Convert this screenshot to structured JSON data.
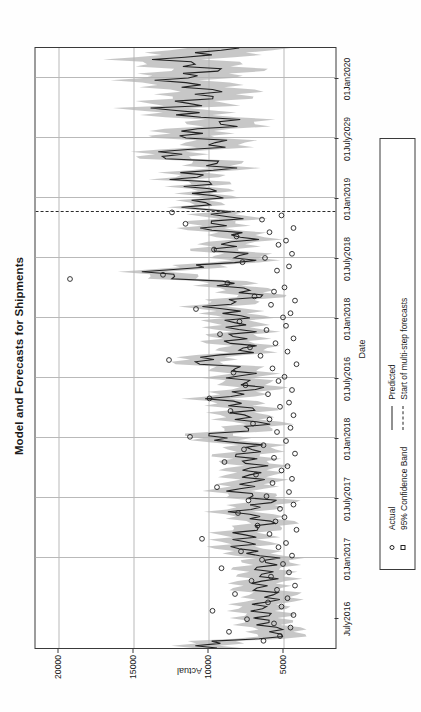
{
  "chart_data": {
    "type": "line",
    "title": "Model and Forecasts for Shipments",
    "xlabel": "Date",
    "ylabel": "Actual",
    "grid": true,
    "legend_position": "below-plot",
    "xtick_labels": [
      "July2016",
      "01Jan2017",
      "01July2017",
      "01Jan2018",
      "01July2016",
      "01Jan2018",
      "01July2018",
      "01Jan2019",
      "01July2029",
      "01Jan2020"
    ],
    "ytick_labels": [
      "5000",
      "10000",
      "15000",
      "20000"
    ],
    "ylim": [
      1500,
      21500
    ],
    "yticks": [
      5000,
      10000,
      15000,
      20000
    ],
    "forecast_start_label": "Start of multi-step forecasts",
    "forecast_start_x_fraction": 0.726,
    "series": [
      {
        "name": "Actual",
        "marker": "open-circle",
        "values": [
          [
            0.012,
            6300
          ],
          [
            0.02,
            5200
          ],
          [
            0.027,
            8600
          ],
          [
            0.034,
            4500
          ],
          [
            0.041,
            5600
          ],
          [
            0.048,
            7400
          ],
          [
            0.055,
            4300
          ],
          [
            0.062,
            9700
          ],
          [
            0.069,
            5100
          ],
          [
            0.076,
            6000
          ],
          [
            0.083,
            4700
          ],
          [
            0.09,
            8200
          ],
          [
            0.097,
            5400
          ],
          [
            0.104,
            4200
          ],
          [
            0.112,
            7100
          ],
          [
            0.119,
            5800
          ],
          [
            0.126,
            4600
          ],
          [
            0.133,
            9100
          ],
          [
            0.14,
            5000
          ],
          [
            0.147,
            6400
          ],
          [
            0.154,
            4400
          ],
          [
            0.161,
            7800
          ],
          [
            0.168,
            5300
          ],
          [
            0.175,
            4800
          ],
          [
            0.182,
            10400
          ],
          [
            0.19,
            5900
          ],
          [
            0.197,
            4100
          ],
          [
            0.204,
            6700
          ],
          [
            0.211,
            5500
          ],
          [
            0.218,
            4900
          ],
          [
            0.225,
            8000
          ],
          [
            0.232,
            5200
          ],
          [
            0.239,
            4300
          ],
          [
            0.246,
            7300
          ],
          [
            0.253,
            6100
          ],
          [
            0.26,
            4600
          ],
          [
            0.268,
            9400
          ],
          [
            0.275,
            5700
          ],
          [
            0.282,
            4400
          ],
          [
            0.289,
            6800
          ],
          [
            0.296,
            5100
          ],
          [
            0.303,
            4700
          ],
          [
            0.31,
            8900
          ],
          [
            0.317,
            5600
          ],
          [
            0.324,
            4200
          ],
          [
            0.331,
            7600
          ],
          [
            0.338,
            6300
          ],
          [
            0.345,
            4800
          ],
          [
            0.352,
            11200
          ],
          [
            0.36,
            5400
          ],
          [
            0.367,
            4500
          ],
          [
            0.374,
            7000
          ],
          [
            0.381,
            5900
          ],
          [
            0.388,
            4300
          ],
          [
            0.395,
            8500
          ],
          [
            0.402,
            5200
          ],
          [
            0.409,
            4600
          ],
          [
            0.416,
            9900
          ],
          [
            0.423,
            6000
          ],
          [
            0.43,
            4400
          ],
          [
            0.438,
            7500
          ],
          [
            0.445,
            5300
          ],
          [
            0.452,
            4900
          ],
          [
            0.459,
            8300
          ],
          [
            0.466,
            5700
          ],
          [
            0.473,
            4100
          ],
          [
            0.48,
            12600
          ],
          [
            0.487,
            6500
          ],
          [
            0.494,
            4700
          ],
          [
            0.501,
            7200
          ],
          [
            0.508,
            5500
          ],
          [
            0.516,
            4300
          ],
          [
            0.523,
            9200
          ],
          [
            0.53,
            6100
          ],
          [
            0.537,
            4800
          ],
          [
            0.544,
            7900
          ],
          [
            0.551,
            5000
          ],
          [
            0.558,
            4500
          ],
          [
            0.565,
            10800
          ],
          [
            0.572,
            5800
          ],
          [
            0.579,
            4200
          ],
          [
            0.586,
            6900
          ],
          [
            0.594,
            5600
          ],
          [
            0.601,
            4900
          ],
          [
            0.608,
            8700
          ],
          [
            0.615,
            19200
          ],
          [
            0.622,
            13000
          ],
          [
            0.629,
            5400
          ],
          [
            0.636,
            4600
          ],
          [
            0.643,
            7700
          ],
          [
            0.65,
            6200
          ],
          [
            0.657,
            4400
          ],
          [
            0.664,
            9600
          ],
          [
            0.672,
            5300
          ],
          [
            0.679,
            4800
          ],
          [
            0.686,
            8100
          ],
          [
            0.693,
            5900
          ],
          [
            0.7,
            4300
          ],
          [
            0.707,
            11500
          ],
          [
            0.714,
            6400
          ],
          [
            0.721,
            5100
          ],
          [
            0.726,
            12400
          ]
        ]
      },
      {
        "name": "Predicted",
        "marker": "none",
        "style": "solid",
        "values": [
          [
            0.012,
            6000
          ],
          [
            0.034,
            5400
          ],
          [
            0.055,
            6800
          ],
          [
            0.076,
            5900
          ],
          [
            0.097,
            6200
          ],
          [
            0.119,
            6500
          ],
          [
            0.14,
            5800
          ],
          [
            0.161,
            7000
          ],
          [
            0.182,
            8200
          ],
          [
            0.204,
            6100
          ],
          [
            0.225,
            7400
          ],
          [
            0.246,
            6300
          ],
          [
            0.268,
            8000
          ],
          [
            0.289,
            6600
          ],
          [
            0.31,
            7600
          ],
          [
            0.331,
            6900
          ],
          [
            0.352,
            9400
          ],
          [
            0.374,
            6700
          ],
          [
            0.395,
            7800
          ],
          [
            0.416,
            8600
          ],
          [
            0.438,
            7100
          ],
          [
            0.459,
            7900
          ],
          [
            0.48,
            10200
          ],
          [
            0.501,
            7300
          ],
          [
            0.523,
            8400
          ],
          [
            0.544,
            7600
          ],
          [
            0.565,
            9300
          ],
          [
            0.586,
            7200
          ],
          [
            0.608,
            8100
          ],
          [
            0.622,
            14800
          ],
          [
            0.643,
            7800
          ],
          [
            0.664,
            8700
          ],
          [
            0.686,
            7900
          ],
          [
            0.707,
            9800
          ],
          [
            0.726,
            8600
          ],
          [
            0.74,
            11300
          ],
          [
            0.76,
            9200
          ],
          [
            0.78,
            11900
          ],
          [
            0.8,
            8800
          ],
          [
            0.82,
            12600
          ],
          [
            0.84,
            9600
          ],
          [
            0.86,
            11100
          ],
          [
            0.88,
            8400
          ],
          [
            0.9,
            13400
          ],
          [
            0.92,
            9000
          ],
          [
            0.94,
            12100
          ],
          [
            0.96,
            10300
          ],
          [
            0.98,
            11700
          ],
          [
            1.0,
            9400
          ]
        ]
      }
    ],
    "confidence_band": {
      "name": "95% Confidence Band",
      "level": "95%",
      "color": "#b0b0b0"
    },
    "colors": {
      "predicted_line": "#222222",
      "band_fill": "#b4b4b4",
      "grid": "#b9b9b9",
      "axis": "#3a3a3a",
      "marker_edge": "#222222"
    }
  },
  "legend": {
    "items": [
      {
        "label": "Actual",
        "key": "open-circle-marker"
      },
      {
        "label": "95% Confidence Band",
        "key": "open-square-marker"
      },
      {
        "label": "Predicted",
        "key": "solid-line"
      },
      {
        "label": "Start of multi-step forecasts",
        "key": "dashed-line"
      }
    ]
  }
}
